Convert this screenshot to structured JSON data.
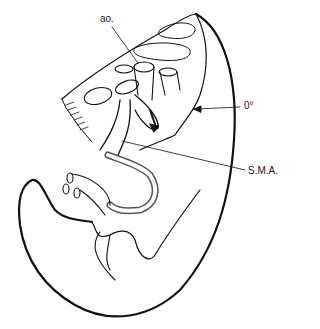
{
  "diagram": {
    "labels": [
      {
        "id": "aorta",
        "text": "ao."
      },
      {
        "id": "rotation-angle",
        "text": "0°"
      },
      {
        "id": "superior-mesenteric-artery",
        "text": "S.M.A."
      }
    ],
    "colors": {
      "line": "#111111",
      "background": "#ffffff"
    }
  }
}
